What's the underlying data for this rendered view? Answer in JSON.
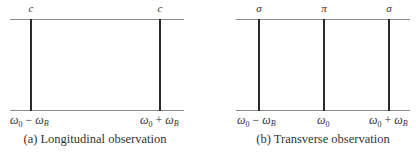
{
  "panels": [
    {
      "id": "a",
      "caption": "(a) Longitudinal observation",
      "lines": [
        {
          "top_label": "c",
          "position_label": "ω0 − ωB",
          "x": 31
        },
        {
          "top_label": "c",
          "position_label": "ω0 + ωB",
          "x": 160
        }
      ]
    },
    {
      "id": "b",
      "caption": "(b) Transverse observation",
      "lines": [
        {
          "top_label": "σ",
          "position_label": "ω0 − ωB",
          "x": 259
        },
        {
          "top_label": "π",
          "position_label": "ω0",
          "x": 324
        },
        {
          "top_label": "σ",
          "position_label": "ω0 + ωB",
          "x": 389
        }
      ]
    }
  ],
  "symbols": {
    "omega": "ω",
    "zero": "0",
    "B": "B",
    "minus": " − ",
    "plus": " + "
  }
}
